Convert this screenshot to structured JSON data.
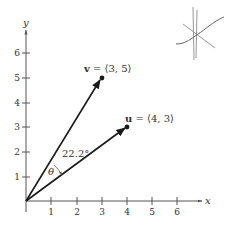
{
  "figure": {
    "axes": {
      "x_label": "x",
      "y_label": "y",
      "x_ticks": [
        "1",
        "2",
        "3",
        "4",
        "5",
        "6"
      ],
      "y_ticks": [
        "1",
        "2",
        "3",
        "4",
        "5",
        "6"
      ]
    },
    "vectors": [
      {
        "name": "v",
        "label_rest": " = ⟨3, 5⟩",
        "x": 3,
        "y": 5
      },
      {
        "name": "u",
        "label_rest": " = ⟨4, 3⟩",
        "x": 4,
        "y": 3
      }
    ],
    "angle": {
      "symbol": "θ",
      "value": "22.2°"
    },
    "colors": {
      "ink": "#1a1a1a",
      "axis": "#555555",
      "faint": "#999999"
    }
  }
}
